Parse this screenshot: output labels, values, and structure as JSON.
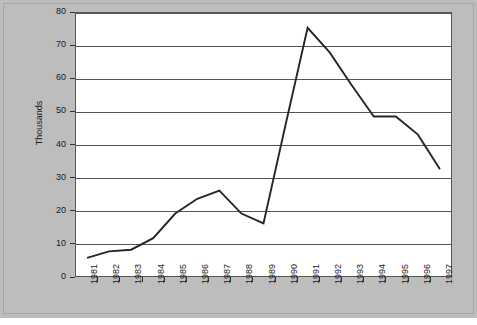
{
  "chart_data": {
    "type": "line",
    "title": "",
    "xlabel": "",
    "ylabel": "Thousands",
    "categories": [
      "1981",
      "1982",
      "1983",
      "1984",
      "1985",
      "1986",
      "1987",
      "1988",
      "1989",
      "1990",
      "1991",
      "1992",
      "1993",
      "1994",
      "1995",
      "1996",
      "1997"
    ],
    "values": [
      5.5,
      7.5,
      8.0,
      11.5,
      19.0,
      23.5,
      26.0,
      19.0,
      16.0,
      46.0,
      75.5,
      68.0,
      58.0,
      48.5,
      48.5,
      43.0,
      32.5
    ],
    "series": [
      {
        "name": "",
        "values": [
          5.5,
          7.5,
          8.0,
          11.5,
          19.0,
          23.5,
          26.0,
          19.0,
          16.0,
          46.0,
          75.5,
          68.0,
          58.0,
          48.5,
          48.5,
          43.0,
          32.5
        ]
      }
    ],
    "ylim": [
      0,
      80
    ],
    "yticks": [
      0,
      10,
      20,
      30,
      40,
      50,
      60,
      70,
      80
    ],
    "ytick_labels": [
      "0",
      "10",
      "20",
      "30",
      "40",
      "50",
      "60",
      "70",
      "80"
    ],
    "grid": true,
    "grid_axis": "y",
    "legend": false,
    "legend_position": "none",
    "line_color": "#262626",
    "plot_background": "#ffffff",
    "figure_background": "#bdbdbd"
  }
}
